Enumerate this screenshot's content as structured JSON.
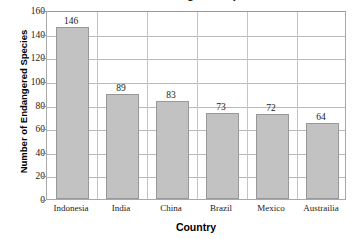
{
  "chart_data": {
    "type": "bar",
    "title": "Number of Endangered Species",
    "xlabel": "Country",
    "ylabel": "Number of Endangered Species",
    "categories": [
      "Indonesia",
      "India",
      "China",
      "Brazil",
      "Mexico",
      "Austrailia"
    ],
    "values": [
      146,
      89,
      83,
      73,
      72,
      64
    ],
    "value_labels": [
      "146",
      "89",
      "83",
      "73",
      "72",
      "64"
    ],
    "ylim": [
      0,
      160
    ],
    "yticks": [
      0,
      20,
      40,
      60,
      80,
      100,
      120,
      140,
      160
    ],
    "ytick_labels": [
      "0",
      "20",
      "40",
      "60",
      "80",
      "100",
      "120",
      "140",
      "160"
    ],
    "grid": "horizontal-and-vertical",
    "legend": "none",
    "bar_color": "#c2c2c2",
    "bar_border_color": "#989898",
    "gridline_color": "#b9b9b9",
    "axis_color": "#a8a8a8",
    "text_color": "#1a1a1a"
  }
}
